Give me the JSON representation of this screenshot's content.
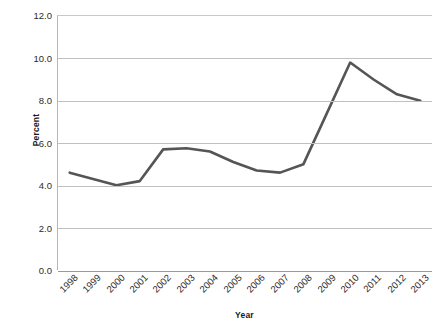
{
  "chart_data": {
    "type": "line",
    "title": "",
    "xlabel": "Year",
    "ylabel": "Percent",
    "categories": [
      "1998",
      "1999",
      "2000",
      "2001",
      "2002",
      "2003",
      "2004",
      "2005",
      "2006",
      "2007",
      "2008",
      "2009",
      "2010",
      "2011",
      "2012",
      "2013"
    ],
    "values": [
      4.6,
      4.3,
      4.0,
      4.2,
      5.7,
      5.75,
      5.6,
      5.1,
      4.7,
      4.6,
      5.0,
      7.4,
      9.8,
      9.0,
      8.3,
      8.0
    ],
    "series": [
      {
        "name": "Percent",
        "values": [
          4.6,
          4.3,
          4.0,
          4.2,
          5.7,
          5.75,
          5.6,
          5.1,
          4.7,
          4.6,
          5.0,
          7.4,
          9.8,
          9.0,
          8.3,
          8.0
        ],
        "color": "#555555"
      }
    ],
    "ylim": [
      0.0,
      12.0
    ],
    "yticks": [
      "0.0",
      "2.0",
      "4.0",
      "6.0",
      "8.0",
      "10.0",
      "12.0"
    ],
    "ytick_values": [
      0.0,
      2.0,
      4.0,
      6.0,
      8.0,
      10.0,
      12.0
    ],
    "grid": "horizontal",
    "legend": "none",
    "line_color": "#555555",
    "gridline_color": "#c0c0c0",
    "markers": false
  }
}
